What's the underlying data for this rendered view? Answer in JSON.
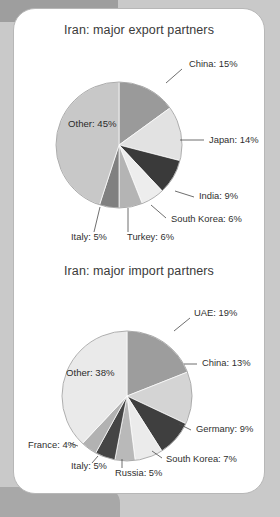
{
  "card": {
    "background_color": "#ffffff",
    "border_color": "#b7b7b7",
    "page_background_color": "#c9c9c9"
  },
  "charts": [
    {
      "id": "export",
      "title": "Iran: major export partners",
      "center": {
        "x": 105,
        "y": 136
      },
      "radius": 63,
      "start_angle_deg": -90,
      "slices": [
        {
          "label": "China: 15%",
          "name": "China",
          "value": 15,
          "color": "#9a9a9a",
          "label_pos": "outside",
          "label_x": 175,
          "label_y": 58,
          "leader": [
            [
              152,
              74
            ],
            [
              168,
              60
            ]
          ]
        },
        {
          "label": "Japan: 14%",
          "name": "Japan",
          "value": 14,
          "color": "#e2e2e2",
          "label_pos": "outside",
          "label_x": 195,
          "label_y": 134,
          "leader": [
            [
              166,
              131
            ],
            [
              190,
              131
            ]
          ]
        },
        {
          "label": "India: 9%",
          "name": "India",
          "value": 9,
          "color": "#3a3a3a",
          "label_pos": "outside",
          "label_x": 185,
          "label_y": 190,
          "leader": [
            [
              161,
              182
            ],
            [
              180,
              188
            ]
          ]
        },
        {
          "label": "South Korea: 6%",
          "name": "South Korea",
          "value": 6,
          "color": "#ededed",
          "label_pos": "outside",
          "label_x": 157,
          "label_y": 213,
          "leader": [
            [
              137,
              196
            ],
            [
              152,
              209
            ]
          ]
        },
        {
          "label": "Turkey: 6%",
          "name": "Turkey",
          "value": 6,
          "color": "#b4b4b4",
          "label_pos": "outside",
          "label_x": 113,
          "label_y": 231,
          "leader": [
            [
              114,
              199
            ],
            [
              114,
              223
            ]
          ]
        },
        {
          "label": "Italy: 5%",
          "name": "Italy",
          "value": 5,
          "color": "#808080",
          "label_pos": "outside",
          "label_x": 57,
          "label_y": 231,
          "leader": [
            [
              86,
              198
            ],
            [
              80,
              223
            ]
          ]
        },
        {
          "label": "Other: 45%",
          "name": "Other",
          "value": 45,
          "color": "#c8c8c8",
          "label_pos": "inside",
          "label_x": 54,
          "label_y": 118
        }
      ]
    },
    {
      "id": "import",
      "title": "Iran: major import partners",
      "center": {
        "x": 113,
        "y": 142
      },
      "radius": 65,
      "start_angle_deg": -90,
      "slices": [
        {
          "label": "UAE: 19%",
          "name": "UAE",
          "value": 19,
          "color": "#9d9d9d",
          "label_pos": "outside",
          "label_x": 180,
          "label_y": 62,
          "leader": [
            [
              160,
              77
            ],
            [
              176,
              64
            ]
          ]
        },
        {
          "label": "China: 13%",
          "name": "China",
          "value": 13,
          "color": "#d4d4d4",
          "label_pos": "outside",
          "label_x": 188,
          "label_y": 112,
          "leader": [
            [
              170,
              110
            ],
            [
              183,
              110
            ]
          ]
        },
        {
          "label": "Germany: 9%",
          "name": "Germany",
          "value": 9,
          "color": "#3f3f3f",
          "label_pos": "outside",
          "label_x": 182,
          "label_y": 178,
          "leader": [
            [
              165,
              170
            ],
            [
              177,
              176
            ]
          ]
        },
        {
          "label": "South Korea: 7%",
          "name": "South Korea",
          "value": 7,
          "color": "#ebebeb",
          "label_pos": "outside",
          "label_x": 152,
          "label_y": 208,
          "leader": [
            [
              138,
              197
            ],
            [
              148,
              204
            ]
          ]
        },
        {
          "label": "Russia: 5%",
          "name": "Russia",
          "value": 5,
          "color": "#b9b9b9",
          "label_pos": "outside",
          "label_x": 101,
          "label_y": 222,
          "leader": [
            [
              108,
              205
            ],
            [
              108,
              214
            ]
          ]
        },
        {
          "label": "Italy: 5%",
          "name": "Italy",
          "value": 5,
          "color": "#454545",
          "label_pos": "outside",
          "label_x": 57,
          "label_y": 215,
          "leader": [
            [
              84,
              202
            ],
            [
              78,
              209
            ]
          ]
        },
        {
          "label": "France: 4%",
          "name": "France",
          "value": 4,
          "color": "#b2b2b2",
          "label_pos": "outside",
          "label_x": 14,
          "label_y": 194,
          "leader": [
            [
              64,
              192
            ],
            [
              56,
              189
            ]
          ]
        },
        {
          "label": "Other: 38%",
          "name": "Other",
          "value": 38,
          "color": "#eaeaea",
          "label_pos": "inside",
          "label_x": 52,
          "label_y": 122
        }
      ]
    }
  ],
  "chart_data": [
    {
      "type": "pie",
      "title": "Iran: major export partners",
      "categories": [
        "China",
        "Japan",
        "India",
        "South Korea",
        "Turkey",
        "Italy",
        "Other"
      ],
      "values": [
        15,
        14,
        9,
        6,
        6,
        5,
        45
      ],
      "unit": "%",
      "labels": [
        "China: 15%",
        "Japan: 14%",
        "India: 9%",
        "South Korea: 6%",
        "Turkey: 6%",
        "Italy: 5%",
        "Other: 45%"
      ],
      "colors": [
        "#9a9a9a",
        "#e2e2e2",
        "#3a3a3a",
        "#ededed",
        "#b4b4b4",
        "#808080",
        "#c8c8c8"
      ],
      "legend": "none",
      "data_labels": "leader-lines",
      "start_angle_deg": -90,
      "direction": "clockwise"
    },
    {
      "type": "pie",
      "title": "Iran: major import partners",
      "categories": [
        "UAE",
        "China",
        "Germany",
        "South Korea",
        "Russia",
        "Italy",
        "France",
        "Other"
      ],
      "values": [
        19,
        13,
        9,
        7,
        5,
        5,
        4,
        38
      ],
      "unit": "%",
      "labels": [
        "UAE: 19%",
        "China: 13%",
        "Germany: 9%",
        "South Korea: 7%",
        "Russia: 5%",
        "Italy: 5%",
        "France: 4%",
        "Other: 38%"
      ],
      "colors": [
        "#9d9d9d",
        "#d4d4d4",
        "#3f3f3f",
        "#ebebeb",
        "#b9b9b9",
        "#454545",
        "#b2b2b2",
        "#eaeaea"
      ],
      "legend": "none",
      "data_labels": "leader-lines",
      "start_angle_deg": -90,
      "direction": "clockwise"
    }
  ]
}
